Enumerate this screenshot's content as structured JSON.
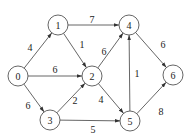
{
  "graph": {
    "directed": true,
    "node_radius": 10,
    "colors": {
      "stroke": "#555555",
      "text": "#222222",
      "background": "#ffffff"
    },
    "nodes": [
      {
        "id": "0",
        "label": "0",
        "x": 18,
        "y": 76
      },
      {
        "id": "1",
        "label": "1",
        "x": 58,
        "y": 25
      },
      {
        "id": "2",
        "label": "2",
        "x": 92,
        "y": 76
      },
      {
        "id": "3",
        "label": "3",
        "x": 50,
        "y": 120
      },
      {
        "id": "4",
        "label": "4",
        "x": 129,
        "y": 25
      },
      {
        "id": "5",
        "label": "5",
        "x": 130,
        "y": 121
      },
      {
        "id": "6",
        "label": "6",
        "x": 173,
        "y": 75
      }
    ],
    "edges": [
      {
        "from": "0",
        "to": "1",
        "weight": "4",
        "lx": 30,
        "ly": 47
      },
      {
        "from": "0",
        "to": "2",
        "weight": "6",
        "lx": 55,
        "ly": 69
      },
      {
        "from": "0",
        "to": "3",
        "weight": "6",
        "lx": 28,
        "ly": 105
      },
      {
        "from": "1",
        "to": "4",
        "weight": "7",
        "lx": 92,
        "ly": 19
      },
      {
        "from": "1",
        "to": "2",
        "weight": "1",
        "lx": 82,
        "ly": 44
      },
      {
        "from": "2",
        "to": "4",
        "weight": "6",
        "lx": 104,
        "ly": 51
      },
      {
        "from": "2",
        "to": "5",
        "weight": "4",
        "lx": 101,
        "ly": 99
      },
      {
        "from": "3",
        "to": "2",
        "weight": "2",
        "lx": 75,
        "ly": 100
      },
      {
        "from": "3",
        "to": "5",
        "weight": "5",
        "lx": 93,
        "ly": 129
      },
      {
        "from": "5",
        "to": "4",
        "weight": "1",
        "lx": 137,
        "ly": 73
      },
      {
        "from": "4",
        "to": "6",
        "weight": "6",
        "lx": 163,
        "ly": 44
      },
      {
        "from": "5",
        "to": "6",
        "weight": "8",
        "lx": 161,
        "ly": 111
      }
    ]
  }
}
